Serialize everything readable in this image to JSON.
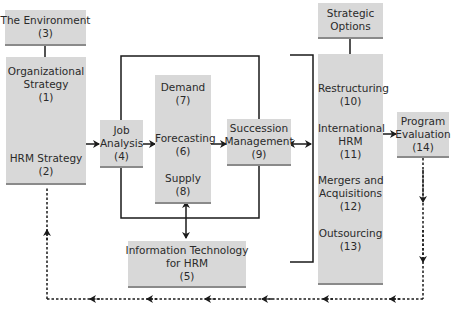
{
  "diagram": {
    "boxes": {
      "environment": {
        "label": "The Environment",
        "num": "(3)"
      },
      "org_strategy": {
        "label_1": "Organizational",
        "label_2": "Strategy",
        "num": "(1)"
      },
      "hrm_strategy": {
        "label": "HRM Strategy",
        "num": "(2)"
      },
      "job_analysis": {
        "label_1": "Job",
        "label_2": "Analysis",
        "num": "(4)"
      },
      "demand": {
        "label": "Demand",
        "num": "(7)"
      },
      "forecasting": {
        "label": "Forecasting",
        "num": "(6)"
      },
      "supply": {
        "label": "Supply",
        "num": "(8)"
      },
      "succession": {
        "label_1": "Succession",
        "label_2": "Management",
        "num": "(9)"
      },
      "info_tech": {
        "label_1": "Information Technology",
        "label_2": "for HRM",
        "num": "(5)"
      },
      "strategic_options": {
        "label_1": "Strategic",
        "label_2": "Options"
      },
      "restructuring": {
        "label": "Restructuring",
        "num": "(10)"
      },
      "international": {
        "label_1": "International",
        "label_2": "HRM",
        "num": "(11)"
      },
      "mergers": {
        "label_1": "Mergers and",
        "label_2": "Acquisitions",
        "num": "(12)"
      },
      "outsourcing": {
        "label": "Outsourcing",
        "num": "(13)"
      },
      "program_eval": {
        "label_1": "Program",
        "label_2": "Evaluation",
        "num": "(14)"
      }
    },
    "colors": {
      "box_fill": "#d8d8d8",
      "box_edge": "#8a8a8a",
      "line": "#1a1a1a"
    }
  }
}
